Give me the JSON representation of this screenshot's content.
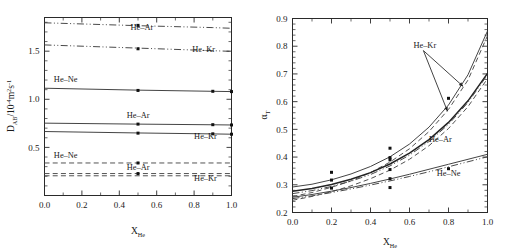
{
  "figure": {
    "panels": [
      "left",
      "right"
    ]
  },
  "chart_data": [
    {
      "panel": "left",
      "type": "line",
      "title": "",
      "xlabel": "X_He",
      "xlabel_base": "X",
      "xlabel_sub": "He",
      "ylabel": "D_AB/10^-4 m^2 s^-1",
      "ylabel_parts": {
        "base": "D",
        "sub1": "AB",
        "mid": "/10",
        "sup1": "-4",
        "mid2": "m",
        "sup2": "2",
        "mid3": "s",
        "sup3": "-1"
      },
      "xlim": [
        0.0,
        1.0
      ],
      "ylim": [
        0.0,
        1.85
      ],
      "xticks": [
        0.0,
        0.2,
        0.4,
        0.6,
        0.8,
        1.0
      ],
      "xticklabels": [
        "0.0",
        "0.2",
        "0.4",
        "0.6",
        "0.8",
        "1.0"
      ],
      "yticks": [
        0.5,
        1.0,
        1.5
      ],
      "yticklabels": [
        "0.5",
        "1.0",
        "1.5"
      ],
      "grid": false,
      "legend_position": "inline-annotations",
      "series": [
        {
          "name": "He-Ar",
          "group": "upper",
          "style": "dash-dot-dot",
          "label": "He–Ar",
          "label_x": 0.46,
          "label_y": 1.715,
          "x": [
            0.0,
            0.5,
            0.9,
            1.0
          ],
          "values": [
            1.795,
            1.765,
            1.745,
            1.738
          ]
        },
        {
          "name": "He-Kr",
          "group": "upper",
          "style": "dash-dot-dot",
          "label": "He–Kr",
          "label_x": 0.79,
          "label_y": 1.495,
          "x": [
            0.0,
            0.5,
            0.9,
            1.0
          ],
          "values": [
            1.565,
            1.532,
            1.505,
            1.498
          ]
        },
        {
          "name": "He-Ne",
          "group": "middle",
          "style": "solid",
          "label": "He–Ne",
          "label_x": 0.05,
          "label_y": 1.175,
          "x": [
            0.0,
            0.5,
            0.9,
            1.0
          ],
          "values": [
            1.115,
            1.095,
            1.083,
            1.08
          ]
        },
        {
          "name": "He-Ar",
          "group": "middle",
          "style": "solid",
          "label": "He–Ar",
          "label_x": 0.44,
          "label_y": 0.805,
          "x": [
            0.0,
            0.5,
            0.9,
            1.0
          ],
          "values": [
            0.752,
            0.742,
            0.735,
            0.733
          ]
        },
        {
          "name": "He-Kr",
          "group": "middle",
          "style": "solid",
          "label": "He–Kr",
          "label_x": 0.8,
          "label_y": 0.59,
          "x": [
            0.0,
            0.5,
            0.9,
            1.0
          ],
          "values": [
            0.665,
            0.65,
            0.64,
            0.637
          ]
        },
        {
          "name": "He-Ne",
          "group": "lower",
          "style": "dashed",
          "label": "He–Ne",
          "label_x": 0.05,
          "label_y": 0.385,
          "x": [
            0.0,
            1.0
          ],
          "values": [
            0.338,
            0.338
          ]
        },
        {
          "name": "He-Ar",
          "group": "lower",
          "style": "dashed",
          "label": "He–Ar",
          "label_x": 0.44,
          "label_y": 0.262,
          "x": [
            0.0,
            1.0
          ],
          "values": [
            0.228,
            0.228
          ]
        },
        {
          "name": "He-Kr",
          "group": "lower",
          "style": "dashed",
          "label": "He–Kr",
          "label_x": 0.8,
          "label_y": 0.15,
          "x": [
            0.0,
            1.0
          ],
          "values": [
            0.205,
            0.205
          ]
        }
      ],
      "points": [
        {
          "series": "He-Ar-upper",
          "x": 0.5,
          "y": 1.768
        },
        {
          "series": "He-Kr-upper",
          "x": 0.5,
          "y": 1.525
        },
        {
          "series": "He-Ne-middle",
          "x": 0.5,
          "y": 1.092
        },
        {
          "series": "He-Ne-middle",
          "x": 0.9,
          "y": 1.083
        },
        {
          "series": "He-Ne-middle",
          "x": 1.0,
          "y": 1.08
        },
        {
          "series": "He-Ar-middle",
          "x": 0.5,
          "y": 0.742
        },
        {
          "series": "He-Ar-middle",
          "x": 0.9,
          "y": 0.736
        },
        {
          "series": "He-Ar-middle",
          "x": 1.0,
          "y": 0.733
        },
        {
          "series": "He-Kr-middle",
          "x": 0.5,
          "y": 0.648
        },
        {
          "series": "He-Kr-middle",
          "x": 0.9,
          "y": 0.641
        },
        {
          "series": "He-Kr-middle",
          "x": 1.0,
          "y": 0.637
        },
        {
          "series": "He-Ne-lower",
          "x": 0.5,
          "y": 0.338
        },
        {
          "series": "He-Ar-lower",
          "x": 0.5,
          "y": 0.228
        }
      ]
    },
    {
      "panel": "right",
      "type": "line",
      "title": "",
      "xlabel": "X_He",
      "xlabel_base": "X",
      "xlabel_sub": "He",
      "ylabel": "alpha_T",
      "ylabel_parts": {
        "base": "α",
        "sub1": "T"
      },
      "xlim": [
        0.0,
        1.0
      ],
      "ylim": [
        0.2,
        0.9
      ],
      "xticks": [
        0.0,
        0.2,
        0.4,
        0.6,
        0.8,
        1.0
      ],
      "xticklabels": [
        "0.0",
        "0.2",
        "0.4",
        "0.6",
        "0.8",
        "1.0"
      ],
      "yticks": [
        0.2,
        0.3,
        0.4,
        0.5,
        0.6,
        0.7,
        0.8,
        0.9
      ],
      "yticklabels": [
        "0.2",
        "0.3",
        "0.4",
        "0.5",
        "0.6",
        "0.7",
        "0.8",
        "0.9"
      ],
      "grid": false,
      "legend_position": "inline-annotations",
      "annotations": [
        {
          "text": "He–Kr",
          "x": 0.62,
          "y": 0.795,
          "arrows": 2
        },
        {
          "text": "He–Ar",
          "x": 0.7,
          "y": 0.455,
          "arrows": 0
        },
        {
          "text": "He–Ne",
          "x": 0.74,
          "y": 0.33,
          "arrows": 0
        }
      ],
      "series": [
        {
          "name": "He-Kr solid",
          "style": "solid",
          "x": [
            0.0,
            0.1,
            0.2,
            0.3,
            0.4,
            0.5,
            0.6,
            0.7,
            0.8,
            0.9,
            1.0
          ],
          "values": [
            0.292,
            0.302,
            0.318,
            0.339,
            0.366,
            0.401,
            0.447,
            0.508,
            0.588,
            0.697,
            0.855
          ]
        },
        {
          "name": "He-Kr dashed",
          "style": "dashed",
          "x": [
            0.0,
            0.1,
            0.2,
            0.3,
            0.4,
            0.5,
            0.6,
            0.7,
            0.8,
            0.9,
            1.0
          ],
          "values": [
            0.258,
            0.272,
            0.291,
            0.314,
            0.344,
            0.382,
            0.43,
            0.492,
            0.572,
            0.678,
            0.838
          ]
        },
        {
          "name": "He-Ar solid",
          "style": "solid-thick",
          "x": [
            0.0,
            0.1,
            0.2,
            0.3,
            0.4,
            0.5,
            0.6,
            0.7,
            0.8,
            0.9,
            1.0
          ],
          "values": [
            0.277,
            0.287,
            0.301,
            0.32,
            0.344,
            0.375,
            0.414,
            0.463,
            0.525,
            0.603,
            0.702
          ]
        },
        {
          "name": "He-Ar dashed",
          "style": "dashed",
          "x": [
            0.0,
            0.1,
            0.2,
            0.3,
            0.4,
            0.5,
            0.6,
            0.7,
            0.8,
            0.9,
            1.0
          ],
          "values": [
            0.244,
            0.258,
            0.275,
            0.296,
            0.322,
            0.353,
            0.392,
            0.441,
            0.503,
            0.582,
            0.683
          ]
        },
        {
          "name": "He-Ar dash-dot",
          "style": "dash-dot",
          "x": [
            0.0,
            0.1,
            0.2,
            0.3,
            0.4,
            0.5,
            0.6,
            0.7,
            0.8,
            0.9,
            1.0
          ],
          "values": [
            0.268,
            0.279,
            0.294,
            0.313,
            0.337,
            0.368,
            0.407,
            0.456,
            0.518,
            0.597,
            0.697
          ]
        },
        {
          "name": "He-Ne solid",
          "style": "solid",
          "x": [
            0.0,
            0.1,
            0.2,
            0.3,
            0.4,
            0.5,
            0.6,
            0.7,
            0.8,
            0.9,
            1.0
          ],
          "values": [
            0.255,
            0.265,
            0.277,
            0.29,
            0.305,
            0.321,
            0.338,
            0.356,
            0.374,
            0.392,
            0.41
          ]
        },
        {
          "name": "He-Ne dash-dot",
          "style": "dash-dot",
          "x": [
            0.0,
            0.1,
            0.2,
            0.3,
            0.4,
            0.5,
            0.6,
            0.7,
            0.8,
            0.9,
            1.0
          ],
          "values": [
            0.25,
            0.26,
            0.272,
            0.285,
            0.299,
            0.314,
            0.33,
            0.347,
            0.365,
            0.383,
            0.401
          ]
        }
      ],
      "points": [
        {
          "x": 0.2,
          "y": 0.345
        },
        {
          "x": 0.2,
          "y": 0.317
        },
        {
          "x": 0.2,
          "y": 0.288
        },
        {
          "x": 0.5,
          "y": 0.432
        },
        {
          "x": 0.5,
          "y": 0.398
        },
        {
          "x": 0.5,
          "y": 0.39
        },
        {
          "x": 0.5,
          "y": 0.355
        },
        {
          "x": 0.5,
          "y": 0.322
        },
        {
          "x": 0.5,
          "y": 0.29
        },
        {
          "x": 0.8,
          "y": 0.612
        },
        {
          "x": 0.8,
          "y": 0.358
        }
      ]
    }
  ]
}
